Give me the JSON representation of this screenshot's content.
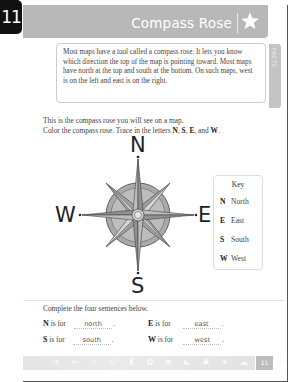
{
  "page_badge": "11",
  "header": {
    "title": "Compass Rose",
    "icon": "star-icon",
    "band_color": "#b8b8b8"
  },
  "facts": {
    "tab_label": "FACTS",
    "text": "Most maps have a tool called a compass rose. It lets you know which direction the top of the map is pointing toward. Most maps have north at the top and south at the bottom. On such maps, west is on the left and east is on the right."
  },
  "instructions": {
    "line1": "This is the compass rose you will see on a map.",
    "line2_prefix": "Color the compass rose. Trace in the letters ",
    "n": "N",
    "sep1": ", ",
    "s": "S",
    "sep2": ", ",
    "e": "E",
    "sep3": ", and ",
    "w": "W",
    "end": "."
  },
  "compass": {
    "north": "N",
    "south": "S",
    "east": "E",
    "west": "W"
  },
  "key": {
    "title": "Key",
    "rows": [
      {
        "letter": "N",
        "label": "North"
      },
      {
        "letter": "E",
        "label": "East"
      },
      {
        "letter": "S",
        "label": "South"
      },
      {
        "letter": "W",
        "label": "West"
      }
    ]
  },
  "exercise": {
    "title": "Complete the four sentences below.",
    "sentences": [
      {
        "letter": "N",
        "text": " is for",
        "answer": "north",
        "end": "."
      },
      {
        "letter": "E",
        "text": " is for",
        "answer": "east",
        "end": "."
      },
      {
        "letter": "S",
        "text": " is for",
        "answer": "south",
        "end": "."
      },
      {
        "letter": "W",
        "text": " is for",
        "answer": "west",
        "end": "."
      }
    ]
  },
  "footer": {
    "icons": "✈ ✂ ☼ ⊙ ♜ ✿ ❀ ☯ ♣ ✦ ☁ ♞ ☂",
    "page_number": "11"
  }
}
